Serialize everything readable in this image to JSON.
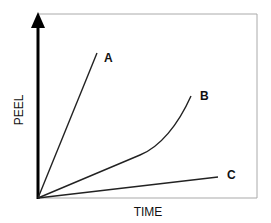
{
  "diagram": {
    "type": "peel-vs-time schematic",
    "x_axis_label": "TIME",
    "y_axis_label": "PEEL",
    "curves": [
      {
        "label": "A",
        "shape": "steep straight line"
      },
      {
        "label": "B",
        "shape": "linear then accelerating curve"
      },
      {
        "label": "C",
        "shape": "shallow straight line"
      }
    ],
    "colors": {
      "axis": "#000000",
      "frame": "#aaaaaa",
      "curve": "#222222",
      "text": "#111111"
    }
  }
}
